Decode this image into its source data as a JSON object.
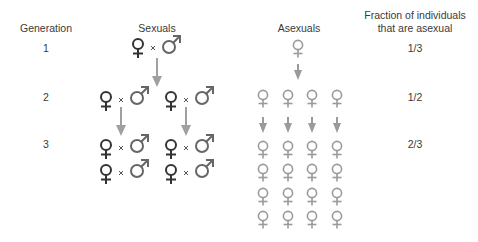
{
  "headers": {
    "generation": "Generation",
    "sexuals": "Sexuals",
    "asexuals": "Asexuals",
    "fraction_line1": "Fraction of individuals",
    "fraction_line2": "that are asexual"
  },
  "generations": [
    {
      "number": "1",
      "fraction": "1/3",
      "sexual_pairs": 1,
      "asexual_females": 1
    },
    {
      "number": "2",
      "fraction": "1/2",
      "sexual_pairs": 2,
      "asexual_females": 4
    },
    {
      "number": "3",
      "fraction": "2/3",
      "sexual_pairs": 4,
      "asexual_females": 16
    }
  ],
  "cross_symbol": "×",
  "colors": {
    "text": "#3a3a3a",
    "sexual_female": "#333333",
    "male": "#666666",
    "asexual_female": "#9a9a9a",
    "arrow": "#a0a0a0"
  }
}
